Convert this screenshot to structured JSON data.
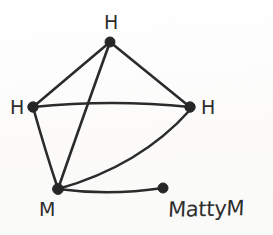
{
  "canvas": {
    "width": 273,
    "height": 235,
    "background_color": "#fdfcfb",
    "ink_color": "#2b2b2b",
    "style": "hand-drawn pen sketch on paper"
  },
  "graph": {
    "type": "undirected-graph",
    "node_count": 5,
    "edge_count": 7,
    "nodes": [
      {
        "id": "n1",
        "label": "H",
        "cx": 110,
        "cy": 42,
        "r": 5.0,
        "label_x": 104,
        "label_y": 13,
        "label_anchor": "above"
      },
      {
        "id": "n2",
        "label": "H",
        "cx": 33,
        "cy": 107,
        "r": 5.2,
        "label_x": 10,
        "label_y": 98,
        "label_anchor": "left"
      },
      {
        "id": "n3",
        "label": "H",
        "cx": 190,
        "cy": 107,
        "r": 5.2,
        "label_x": 201,
        "label_y": 98,
        "label_anchor": "right"
      },
      {
        "id": "n4",
        "label": "M",
        "cx": 58,
        "cy": 189,
        "r": 5.4,
        "label_x": 39,
        "label_y": 200,
        "label_anchor": "below-left"
      },
      {
        "id": "n5",
        "label": "",
        "cx": 163,
        "cy": 188,
        "r": 5.0,
        "label_x": 0,
        "label_y": 0,
        "label_anchor": "none"
      }
    ],
    "edges": [
      {
        "id": "e1",
        "from": "n1",
        "to": "n2",
        "shape": "line",
        "d": "M 110 42 L 33 107"
      },
      {
        "id": "e2",
        "from": "n1",
        "to": "n3",
        "shape": "line",
        "d": "M 110 42 L 190 107"
      },
      {
        "id": "e3",
        "from": "n1",
        "to": "n4",
        "shape": "line",
        "d": "M 110 42 Q 83 117 58 189"
      },
      {
        "id": "e4",
        "from": "n2",
        "to": "n3",
        "shape": "curve",
        "d": "M 33 107 Q 112 99 190 107"
      },
      {
        "id": "e5",
        "from": "n2",
        "to": "n4",
        "shape": "line",
        "d": "M 33 107 Q 45 150 58 189"
      },
      {
        "id": "e6",
        "from": "n4",
        "to": "n3",
        "shape": "curve",
        "d": "M 58 189 Q 140 166 190 110"
      },
      {
        "id": "e7",
        "from": "n4",
        "to": "n5",
        "shape": "curve",
        "d": "M 58 189 Q 110 196 163 188"
      }
    ]
  },
  "annotations": {
    "signature": {
      "text": "MattyM",
      "x": 168,
      "y": 199
    }
  }
}
